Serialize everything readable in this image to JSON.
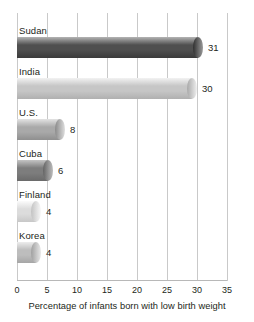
{
  "chart_data": {
    "type": "bar",
    "orientation": "horizontal",
    "title": "",
    "xlabel": "Percentage of infants born with low birth weight",
    "ylabel": "",
    "xlim": [
      0,
      35
    ],
    "xticks": [
      0,
      5,
      10,
      15,
      20,
      25,
      30,
      35
    ],
    "grid": true,
    "legend": "none",
    "categories": [
      "Sudan",
      "India",
      "U.S.",
      "Cuba",
      "Finland",
      "Korea"
    ],
    "values": [
      31,
      30,
      8,
      6,
      4,
      4
    ],
    "value_labels": [
      "31",
      "30",
      "8",
      "6",
      "4",
      "4"
    ],
    "bars": [
      {
        "label": "Sudan",
        "value": 31,
        "value_label": "31",
        "color_light": "#b4b4b4",
        "color_mid": "#4f4f4f",
        "color_dark": "#3a3a3a",
        "cap_light": "#9a9a9a",
        "cap_dark": "#2f2f2f"
      },
      {
        "label": "India",
        "value": 30,
        "value_label": "30",
        "color_light": "#f2f2f2",
        "color_mid": "#c6c6c6",
        "color_dark": "#b0b0b0",
        "cap_light": "#efefef",
        "cap_dark": "#a8a8a8"
      },
      {
        "label": "U.S.",
        "value": 8,
        "value_label": "8",
        "color_light": "#e3e3e3",
        "color_mid": "#a9a9a9",
        "color_dark": "#8f8f8f",
        "cap_light": "#dedede",
        "cap_dark": "#8a8a8a"
      },
      {
        "label": "Cuba",
        "value": 6,
        "value_label": "6",
        "color_light": "#c4c4c4",
        "color_mid": "#7d7d7d",
        "color_dark": "#6a6a6a",
        "cap_light": "#bdbdbd",
        "cap_dark": "#636363"
      },
      {
        "label": "Finland",
        "value": 4,
        "value_label": "4",
        "color_light": "#fbfbfb",
        "color_mid": "#dcdcdc",
        "color_dark": "#c8c8c8",
        "cap_light": "#f8f8f8",
        "cap_dark": "#c2c2c2"
      },
      {
        "label": "Korea",
        "value": 4,
        "value_label": "4",
        "color_light": "#ededed",
        "color_mid": "#bdbdbd",
        "color_dark": "#a6a6a6",
        "cap_light": "#e8e8e8",
        "cap_dark": "#a0a0a0"
      }
    ]
  },
  "axis": {
    "tick_labels": [
      "0",
      "5",
      "10",
      "15",
      "20",
      "25",
      "30",
      "35"
    ],
    "caption": "Percentage of infants born with low birth weight"
  },
  "style": {
    "gridline_color": "#c9c9c9",
    "text_color": "#231f20",
    "background": "#ffffff"
  }
}
